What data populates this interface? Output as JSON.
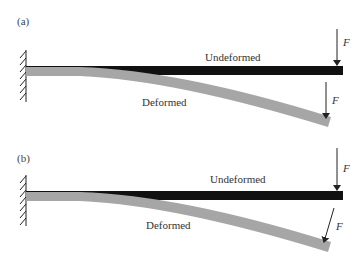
{
  "figure": {
    "panels": [
      {
        "id": "a",
        "label": "(a)",
        "undeformed_label": "Undeformed",
        "deformed_label": "Deformed",
        "force_undeformed": "F",
        "force_deformed": "F",
        "force_direction_deformed": "vertical"
      },
      {
        "id": "b",
        "label": "(b)",
        "undeformed_label": "Undeformed",
        "deformed_label": "Deformed",
        "force_undeformed": "F",
        "force_deformed": "F",
        "force_direction_deformed": "perpendicular to beam (follower)"
      }
    ],
    "colors": {
      "undeformed_beam": "#111111",
      "deformed_beam": "#a6a6a6",
      "wall_hatch": "#222222",
      "arrow": "#222222"
    }
  }
}
